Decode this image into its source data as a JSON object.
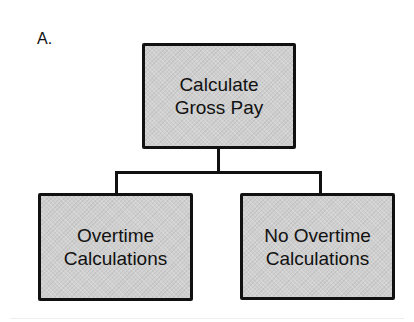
{
  "diagram": {
    "label": "A.",
    "root": {
      "line1": "Calculate",
      "line2": "Gross Pay"
    },
    "children": [
      {
        "line1": "Overtime",
        "line2": "Calculations"
      },
      {
        "line1": "No Overtime",
        "line2": "Calculations"
      }
    ],
    "colors": {
      "box_fill": "#cfcfcf",
      "border": "#111111",
      "background": "#ffffff"
    }
  }
}
